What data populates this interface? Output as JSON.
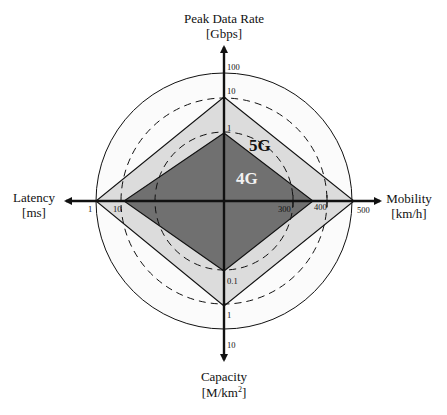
{
  "diagram": {
    "type": "radar-comparison",
    "colors": {
      "background": "#ffffff",
      "outer_circle_fill": "#fbfbfb",
      "fill_5g": "#dcdcdc",
      "fill_4g": "#707070",
      "stroke": "#111111",
      "label_5g": "#111111",
      "label_4g": "#f2f2f2"
    },
    "axes": {
      "top": {
        "title": "Peak Data Rate",
        "unit": "[Gbps]",
        "ticks": [
          "100",
          "10",
          "1"
        ]
      },
      "left": {
        "title": "Latency",
        "unit": "[ms]",
        "ticks": [
          "1",
          "10"
        ]
      },
      "right": {
        "title": "Mobility",
        "unit": "[km/h]",
        "ticks": [
          "300",
          "400",
          "500"
        ]
      },
      "bottom": {
        "title": "Capacity",
        "unit_prefix": "[M/km",
        "unit_sup": "2",
        "unit_suffix": "]",
        "ticks": [
          "0.1",
          "1",
          "10"
        ]
      }
    },
    "series": [
      {
        "name": "5G",
        "peak_data_rate": "10",
        "latency": "1",
        "mobility": "500",
        "capacity": "1"
      },
      {
        "name": "4G",
        "peak_data_rate": "1",
        "latency": "10",
        "mobility": "400",
        "capacity": "0.1"
      }
    ],
    "labels": {
      "g5": "5G",
      "g4": "4G"
    }
  }
}
